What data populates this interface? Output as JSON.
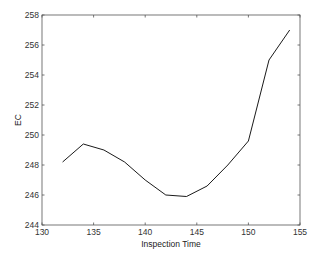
{
  "chart_data": {
    "type": "line",
    "title": "",
    "xlabel": "Inspection Time",
    "ylabel": "EC",
    "xlim": [
      130,
      155
    ],
    "ylim": [
      244,
      258
    ],
    "xticks": [
      130,
      135,
      140,
      145,
      150,
      155
    ],
    "yticks": [
      244,
      246,
      248,
      250,
      252,
      254,
      256,
      258
    ],
    "grid": false,
    "legend": null,
    "series": [
      {
        "name": "EC",
        "color": "#000000",
        "x": [
          132,
          134,
          136,
          138,
          140,
          142,
          144,
          146,
          148,
          150,
          152,
          154
        ],
        "values": [
          248.2,
          249.4,
          249.0,
          248.2,
          247.0,
          246.0,
          245.9,
          246.6,
          248.0,
          249.6,
          255.0,
          257.0
        ]
      }
    ]
  }
}
